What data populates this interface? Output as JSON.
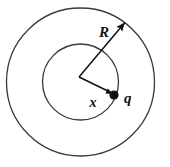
{
  "figure": {
    "background_color": "#ffffff",
    "stroke_color": "#3a3a3a",
    "line_color": "#111111",
    "label_color": "#111111",
    "geometry": {
      "center": {
        "x": 80.5,
        "y": 82
      },
      "outer_circle": {
        "cx": 80.5,
        "cy": 82,
        "r": 74
      },
      "inner_circle": {
        "cx": 80.5,
        "cy": 82,
        "r": 38
      },
      "charge_dot": {
        "cx": 114,
        "cy": 95,
        "r": 4.5
      },
      "radius_arrow": {
        "x1": 79,
        "y1": 77,
        "x2": 126,
        "y2": 21
      },
      "x_segment": {
        "x1": 79,
        "y1": 77,
        "x2": 112,
        "y2": 93
      }
    },
    "labels": [
      {
        "id": "radius-label",
        "text": "R",
        "x": 104,
        "y": 37,
        "size": 15
      },
      {
        "id": "charge-label",
        "text": "q",
        "x": 124,
        "y": 103,
        "size": 15
      },
      {
        "id": "distance-label",
        "text": "x",
        "x": 93,
        "y": 107,
        "size": 14
      }
    ]
  }
}
